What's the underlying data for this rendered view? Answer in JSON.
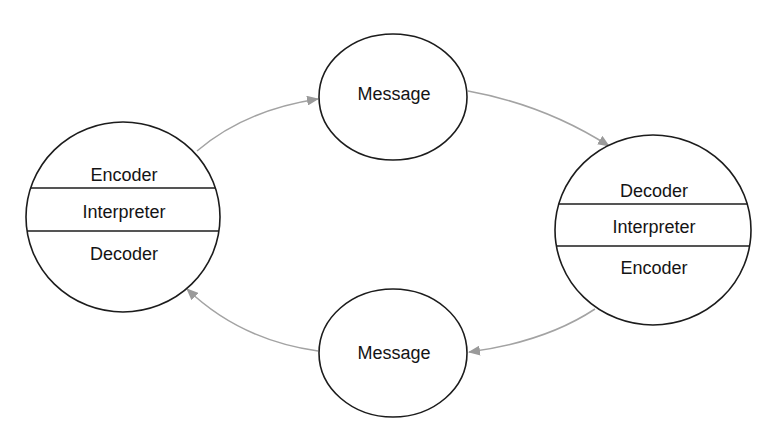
{
  "diagram": {
    "type": "communication-cycle",
    "colors": {
      "background": "#ffffff",
      "outline": "#1c1c1c",
      "arrow": "#a3a3a3",
      "text": "#141414"
    },
    "nodes": {
      "left_party": {
        "layers": [
          "Encoder",
          "Interpreter",
          "Decoder"
        ]
      },
      "right_party": {
        "layers": [
          "Decoder",
          "Interpreter",
          "Encoder"
        ]
      },
      "top_message": {
        "label": "Message"
      },
      "bottom_message": {
        "label": "Message"
      }
    },
    "edges": [
      {
        "from": "left_party",
        "to": "top_message"
      },
      {
        "from": "top_message",
        "to": "right_party"
      },
      {
        "from": "right_party",
        "to": "bottom_message"
      },
      {
        "from": "bottom_message",
        "to": "left_party"
      }
    ]
  }
}
